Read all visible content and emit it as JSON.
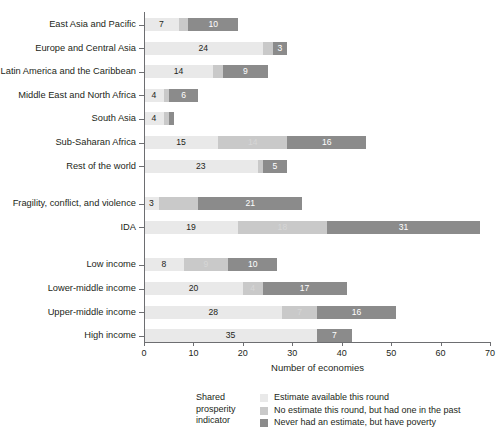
{
  "chart_data": {
    "type": "bar",
    "orientation": "horizontal",
    "stacked": true,
    "title": "",
    "xlabel": "Number of economies",
    "ylabel": "",
    "xlim": [
      0,
      70
    ],
    "xticks": [
      0,
      10,
      20,
      30,
      40,
      50,
      60,
      70
    ],
    "grid": false,
    "legend_position": "bottom",
    "legend_title": "Shared prosperity indicator",
    "categories": [
      "East Asia and Pacific",
      "Europe and Central Asia",
      "Latin America and the Caribbean",
      "Middle East and North Africa",
      "South Asia",
      "Sub-Saharan Africa",
      "Rest of the world",
      "Fragility, conflict, and violence",
      "IDA",
      "Low income",
      "Lower-middle income",
      "Upper-middle income",
      "High income"
    ],
    "series": [
      {
        "name": "Estimate available this round",
        "color": "#e9e9e9",
        "values": [
          7,
          24,
          14,
          4,
          4,
          15,
          23,
          3,
          19,
          8,
          20,
          28,
          35
        ]
      },
      {
        "name": "No estimate this round, but had one in the past",
        "color": "#c9c9c9",
        "values": [
          2,
          2,
          2,
          1,
          1,
          14,
          1,
          8,
          18,
          9,
          4,
          7,
          0
        ]
      },
      {
        "name": "Never had an estimate, but have poverty",
        "color": "#8b8b8b",
        "values": [
          10,
          3,
          9,
          6,
          1,
          16,
          5,
          21,
          31,
          10,
          17,
          16,
          7
        ]
      }
    ],
    "bar_labels": [
      {
        "category": "East Asia and Pacific",
        "a": "7",
        "b": "",
        "c": "10"
      },
      {
        "category": "Europe and Central Asia",
        "a": "24",
        "b": "",
        "c": "3"
      },
      {
        "category": "Latin America and the Caribbean",
        "a": "14",
        "b": "",
        "c": "9"
      },
      {
        "category": "Middle East and North Africa",
        "a": "4",
        "b": "",
        "c": "6"
      },
      {
        "category": "South Asia",
        "a": "4",
        "b": "",
        "c": ""
      },
      {
        "category": "Sub-Saharan Africa",
        "a": "15",
        "b": "14",
        "c": "16"
      },
      {
        "category": "Rest of the world",
        "a": "23",
        "b": "",
        "c": "5"
      },
      {
        "category": "Fragility, conflict, and violence",
        "a": "3",
        "b": "",
        "c": "21"
      },
      {
        "category": "IDA",
        "a": "19",
        "b": "18",
        "c": "31"
      },
      {
        "category": "Low income",
        "a": "8",
        "b": "9",
        "c": "10"
      },
      {
        "category": "Lower-middle income",
        "a": "20",
        "b": "4",
        "c": "17"
      },
      {
        "category": "Upper-middle income",
        "a": "28",
        "b": "7",
        "c": "16"
      },
      {
        "category": "High income",
        "a": "35",
        "b": "",
        "c": "7"
      }
    ],
    "group_breaks_after": [
      "Rest of the world",
      "IDA"
    ]
  },
  "axis": {
    "x_title": "Number of economies",
    "x_tick_labels": [
      "0",
      "10",
      "20",
      "30",
      "40",
      "50",
      "60",
      "70"
    ]
  },
  "legend": {
    "title_lines": [
      "Shared",
      "prosperity",
      "indicator"
    ],
    "items": [
      {
        "label": "Estimate available this round",
        "color": "#e9e9e9"
      },
      {
        "label": "No estimate this round, but had one in the past",
        "color": "#c9c9c9"
      },
      {
        "label": "Never had an estimate, but have poverty",
        "color": "#8b8b8b"
      }
    ]
  }
}
